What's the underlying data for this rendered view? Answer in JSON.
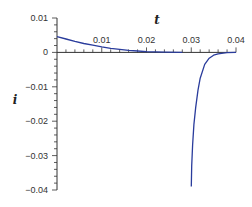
{
  "chart_data": {
    "type": "line",
    "title": "",
    "xlabel": "t",
    "ylabel": "i",
    "xlim": [
      0,
      0.04
    ],
    "ylim": [
      -0.04,
      0.01
    ],
    "grid": false,
    "legend": null,
    "x_ticks": [
      "0.01",
      "0.02",
      "0.03",
      "0.04"
    ],
    "y_ticks": [
      "0.01",
      "0",
      "-0.01",
      "-0.02",
      "-0.03",
      "-0.04"
    ],
    "line_color": "#2a3c9c",
    "series": [
      {
        "name": "branch-1 (decay)",
        "x": [
          0.0,
          0.002,
          0.004,
          0.006,
          0.008,
          0.01,
          0.012,
          0.014,
          0.016,
          0.018,
          0.02,
          0.024,
          0.028
        ],
        "y": [
          0.0046,
          0.0039,
          0.0032,
          0.0026,
          0.0021,
          0.0016,
          0.0012,
          0.0009,
          0.0006,
          0.0004,
          0.0002,
          0.0001,
          0.0
        ]
      },
      {
        "name": "branch-2 (spike)",
        "x": [
          0.03,
          0.0301,
          0.0303,
          0.0306,
          0.031,
          0.0315,
          0.032,
          0.033,
          0.034,
          0.035,
          0.036,
          0.038,
          0.04
        ],
        "y": [
          -0.039,
          -0.033,
          -0.027,
          -0.021,
          -0.016,
          -0.011,
          -0.0075,
          -0.0035,
          -0.0017,
          -0.0008,
          -0.0004,
          -0.0001,
          0.0
        ]
      }
    ]
  }
}
